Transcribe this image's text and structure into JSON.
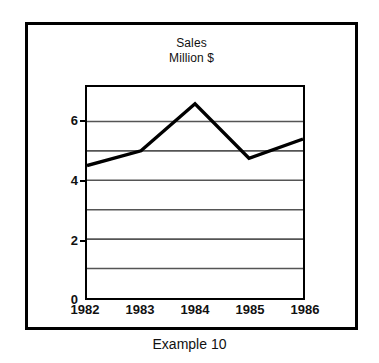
{
  "caption": "Example 10",
  "chart_data": {
    "type": "line",
    "title": "Sales",
    "subtitle": "Million $",
    "title_lines": [
      "Sales",
      "Million $"
    ],
    "xlabel": "",
    "ylabel": "",
    "x": [
      "1982",
      "1983",
      "1984",
      "1985",
      "1986"
    ],
    "categories": [
      "1982",
      "1983",
      "1984",
      "1985",
      "1986"
    ],
    "values": [
      4.5,
      5.0,
      6.6,
      4.75,
      5.4
    ],
    "series": [
      {
        "name": "Sales",
        "values": [
          4.5,
          5.0,
          6.6,
          4.75,
          5.4
        ]
      }
    ],
    "ylim": [
      0,
      7.17
    ],
    "xlim": [
      "1982",
      "1986"
    ],
    "y_ticks": [
      0,
      2,
      4,
      6
    ],
    "y_tick_labels": [
      "0",
      "2",
      "4",
      "6"
    ],
    "y_gridlines": [
      1,
      2,
      3,
      4,
      5,
      6
    ],
    "x_tick_labels": [
      "1982",
      "1983",
      "1984",
      "1985",
      "1986"
    ],
    "grid": true,
    "grid_orientation": "horizontal",
    "legend": false,
    "legend_position": "none",
    "line_color": "#000000",
    "line_width": 3,
    "markers": false,
    "background_color": "#ffffff",
    "axis_color": "#000000",
    "grid_color": "#555555"
  }
}
